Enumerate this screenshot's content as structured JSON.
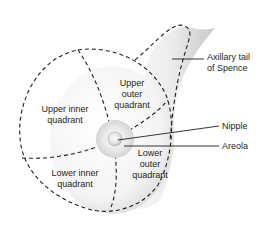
{
  "diagram": {
    "regions": {
      "upper_inner": {
        "line1": "Upper inner",
        "line2": "quadrant"
      },
      "upper_outer": {
        "line1": "Upper",
        "line2": "outer",
        "line3": "quadrant"
      },
      "lower_inner": {
        "line1": "Lower inner",
        "line2": "quadrant"
      },
      "lower_outer": {
        "line1": "Lower",
        "line2": "outer",
        "line3": "quadrant"
      }
    },
    "callouts": {
      "axillary_tail": {
        "line1": "Axillary tail",
        "line2": "of Spence"
      },
      "nipple": "Nipple",
      "areola": "Areola"
    },
    "colors": {
      "line": "#231f20",
      "skin_shadow": "#c8c8c8",
      "background": "#ffffff"
    }
  }
}
